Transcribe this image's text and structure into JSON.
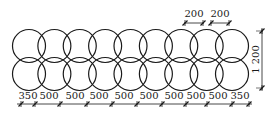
{
  "diagram": {
    "stroke_color": "#1a1a1a",
    "columns": 9,
    "bottom_dimensions": [
      {
        "label": "350",
        "x1": 21,
        "x2": 35,
        "lx": 28
      },
      {
        "label": "500",
        "x1": 35,
        "x2": 60,
        "lx": 49
      },
      {
        "label": "500",
        "x1": 60,
        "x2": 87,
        "lx": 75
      },
      {
        "label": "500",
        "x1": 87,
        "x2": 112,
        "lx": 99
      },
      {
        "label": "500",
        "x1": 112,
        "x2": 137,
        "lx": 124
      },
      {
        "label": "500",
        "x1": 137,
        "x2": 162,
        "lx": 149
      },
      {
        "label": "500",
        "x1": 162,
        "x2": 186,
        "lx": 174
      },
      {
        "label": "500",
        "x1": 186,
        "x2": 207,
        "lx": 196
      },
      {
        "label": "500",
        "x1": 207,
        "x2": 232,
        "lx": 218
      },
      {
        "label": "350",
        "x1": 232,
        "x2": 249,
        "lx": 240
      }
    ],
    "top_dimensions": [
      {
        "label": "200",
        "x1": 185,
        "x2": 203,
        "lx": 194
      },
      {
        "label": "200",
        "x1": 211,
        "x2": 229,
        "lx": 220
      }
    ],
    "height_dimension": {
      "label": "1 200",
      "x": 262,
      "y1": 31,
      "y2": 88
    }
  }
}
